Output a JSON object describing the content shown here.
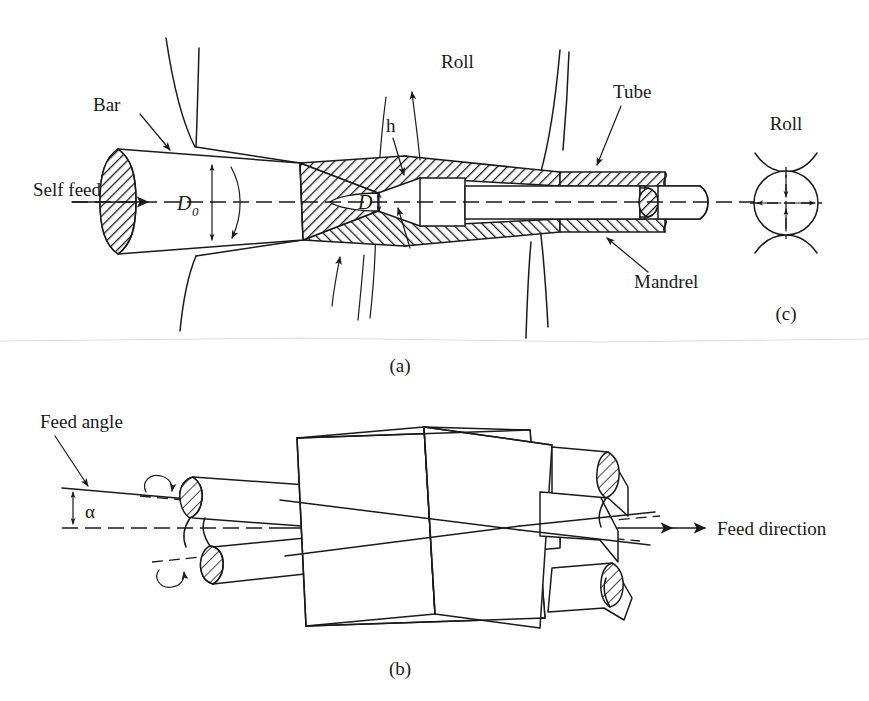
{
  "figure": {
    "background_color": "#ffffff",
    "line_color": "#1a1a1a"
  },
  "panel_a": {
    "caption": "(a)",
    "labels": {
      "self_feed": "Self feed",
      "bar": "Bar",
      "roll": "Roll",
      "tube": "Tube",
      "mandrel": "Mandrel",
      "h": "h",
      "d0_symbol": "D",
      "d0_subscript": "0",
      "d_symbol": "D"
    }
  },
  "panel_b": {
    "caption": "(b)",
    "labels": {
      "feed_angle": "Feed angle",
      "alpha": "α",
      "feed_direction": "Feed direction"
    }
  },
  "panel_c": {
    "caption": "(c)",
    "labels": {
      "roll": "Roll"
    }
  }
}
